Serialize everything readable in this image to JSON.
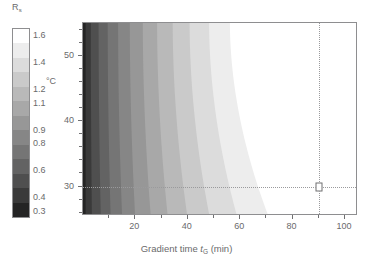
{
  "chart_data": {
    "type": "heatmap",
    "title": "",
    "xlabel": "Gradient time t_G (min)",
    "ylabel": "°C",
    "xlim": [
      0,
      105
    ],
    "ylim": [
      25.5,
      55
    ],
    "grid": false,
    "colorbar": {
      "label": "R",
      "label_sub": "s",
      "orientation": "vertical",
      "vmin": 0.3,
      "vmax": 1.6,
      "tick_labels": [
        "1.6",
        "1.4",
        "1.2",
        "1.1",
        "0.9",
        "0.8",
        "0.6",
        "0.4",
        "0.3"
      ],
      "tick_values": [
        1.6,
        1.4,
        1.2,
        1.1,
        0.9,
        0.8,
        0.6,
        0.4,
        0.3
      ],
      "swatches": [
        "#ffffff",
        "#ededed",
        "#dcdcdc",
        "#cacaca",
        "#b9b9b9",
        "#a8a8a8",
        "#979797",
        "#868686",
        "#757575",
        "#636363",
        "#4f4f4f",
        "#3a3a3a",
        "#242424"
      ]
    },
    "x_ticks": [
      20,
      40,
      60,
      80,
      100
    ],
    "x_tick_labels": [
      "20",
      "40",
      "60",
      "80",
      "100"
    ],
    "x_minor_ticks": [
      10,
      30,
      50,
      70,
      90
    ],
    "y_ticks": [
      30,
      40,
      50
    ],
    "y_tick_labels": [
      "30",
      "40",
      "50"
    ],
    "bands": [
      {
        "value": 0.3,
        "color": "#242424",
        "x_at_top": 1.0,
        "x_at_bottom": 1.0
      },
      {
        "value": 0.4,
        "color": "#3a3a3a",
        "x_at_top": 3.0,
        "x_at_bottom": 3.4
      },
      {
        "value": 0.6,
        "color": "#4f4f4f",
        "x_at_top": 6.0,
        "x_at_bottom": 6.8
      },
      {
        "value": 0.8,
        "color": "#636363",
        "x_at_top": 9.5,
        "x_at_bottom": 10.6
      },
      {
        "value": 0.9,
        "color": "#757575",
        "x_at_top": 13.5,
        "x_at_bottom": 15.0
      },
      {
        "value": 1.0,
        "color": "#868686",
        "x_at_top": 18.0,
        "x_at_bottom": 20.0
      },
      {
        "value": 1.1,
        "color": "#979797",
        "x_at_top": 23.0,
        "x_at_bottom": 26.0
      },
      {
        "value": 1.2,
        "color": "#a8a8a8",
        "x_at_top": 28.5,
        "x_at_bottom": 32.5
      },
      {
        "value": 1.3,
        "color": "#b9b9b9",
        "x_at_top": 34.5,
        "x_at_bottom": 40.0
      },
      {
        "value": 1.4,
        "color": "#cacaca",
        "x_at_top": 41.0,
        "x_at_bottom": 48.5
      },
      {
        "value": 1.5,
        "color": "#dcdcdc",
        "x_at_top": 48.5,
        "x_at_bottom": 59.0
      },
      {
        "value": 1.55,
        "color": "#ededed",
        "x_at_top": 56.5,
        "x_at_bottom": 71.0
      },
      {
        "value": 1.6,
        "color": "#ffffff",
        "x_at_top": 105.0,
        "x_at_bottom": 105.0
      }
    ],
    "annotation": {
      "marker_x": 90,
      "marker_y": 30,
      "guide_style": "dotted",
      "marker_style": "open-square"
    }
  }
}
